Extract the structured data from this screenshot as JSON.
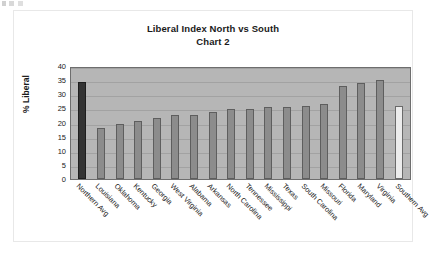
{
  "chart_data": {
    "type": "bar",
    "title": "Liberal Index North vs South",
    "subtitle": "Chart 2",
    "xlabel": "",
    "ylabel": "% Liberal",
    "ylim": [
      0,
      40
    ],
    "ytick_step": 5,
    "yticks": [
      "40",
      "35",
      "30",
      "25",
      "20",
      "15",
      "10",
      "5",
      "0"
    ],
    "grid": true,
    "legend": "none",
    "categories": [
      "Northern Avg",
      "Louisiana",
      "Oklahoma",
      "Kentucky",
      "Georgia",
      "West Virginia",
      "Alabama",
      "Arkansas",
      "North Carolina",
      "Tennessee",
      "Mississippi",
      "Texas",
      "South Carolina",
      "Missouri",
      "Florida",
      "Maryland",
      "Virginia",
      "Southern Avg"
    ],
    "values": [
      34.2,
      18.2,
      19.3,
      20.4,
      21.6,
      22.7,
      22.7,
      23.7,
      24.7,
      24.8,
      25.5,
      25.6,
      25.8,
      26.7,
      32.9,
      34.0,
      35.0,
      25.8
    ],
    "bar_styles": [
      "dark",
      "normal",
      "normal",
      "normal",
      "normal",
      "normal",
      "normal",
      "normal",
      "normal",
      "normal",
      "normal",
      "normal",
      "normal",
      "normal",
      "normal",
      "normal",
      "normal",
      "light"
    ]
  },
  "colors": {
    "plot_background": "#b6b6b6",
    "bar_fill": "#8c8c8c",
    "bar_dark": "#333333",
    "bar_light": "#ececec",
    "gridline": "#a2a2a2",
    "axis": "#6e6e6e",
    "text": "#1a1a1a",
    "page_background": "#ffffff"
  }
}
